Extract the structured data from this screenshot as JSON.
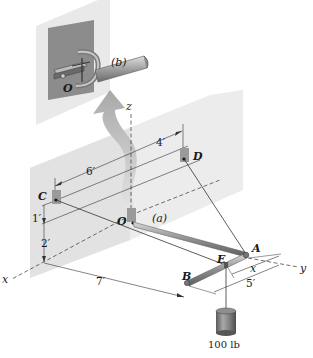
{
  "figure": {
    "inset_label": "(b)",
    "main_label": "(a)",
    "points": {
      "O_inset": "O",
      "O": "O",
      "A": "A",
      "B": "B",
      "C": "C",
      "D": "D",
      "E": "E"
    },
    "axes": {
      "x": "x",
      "y": "y",
      "z": "z"
    },
    "dimensions": {
      "cd_left": "6′",
      "cd_right": "4′",
      "c_height_1": "1′",
      "c_height_2": "2′",
      "x_span": "7′",
      "ab_span": "5′",
      "ae_span": "x"
    },
    "load": "100 lb",
    "colors": {
      "wall": "#e6e6e6",
      "inset_back": "#d9d9d9",
      "inset_plate": "#8a8a8a",
      "bracket": "#9a9a9a",
      "rod": "#9b9b9b",
      "arrow": "#b8b8b8",
      "line": "#333333"
    }
  }
}
